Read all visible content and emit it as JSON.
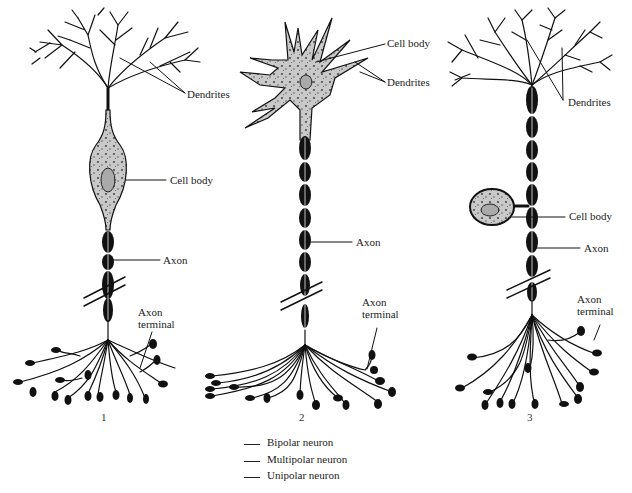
{
  "figure": {
    "neurons": [
      {
        "number": "1",
        "labels": {
          "dendrites": "Dendrites",
          "cell_body": "Cell body",
          "axon": "Axon",
          "axon_terminal_line1": "Axon",
          "axon_terminal_line2": "terminal"
        }
      },
      {
        "number": "2",
        "labels": {
          "cell_body": "Cell body",
          "dendrites": "Dendrites",
          "axon": "Axon",
          "axon_terminal_line1": "Axon",
          "axon_terminal_line2": "terminal"
        }
      },
      {
        "number": "3",
        "labels": {
          "dendrites": "Dendrites",
          "cell_body": "Cell body",
          "axon": "Axon",
          "axon_terminal_line1": "Axon",
          "axon_terminal_line2": "terminal"
        }
      }
    ],
    "answer_key": [
      {
        "blank": "",
        "label": "Bipolar neuron"
      },
      {
        "blank": "",
        "label": "Multipolar neuron"
      },
      {
        "blank": "",
        "label": "Unipolar neuron"
      }
    ],
    "colors": {
      "ink": "#111111",
      "cell_fill": "#c8c8c8",
      "background": "#ffffff"
    }
  }
}
